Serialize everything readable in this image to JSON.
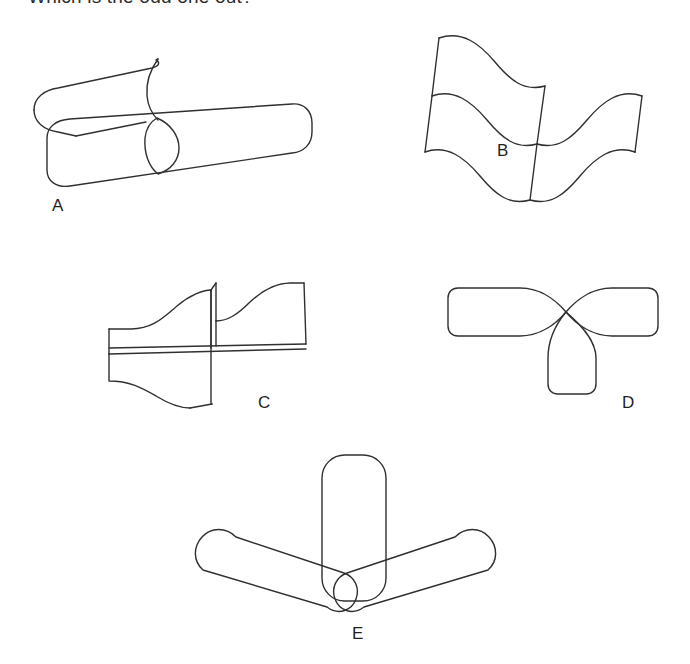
{
  "page": {
    "kind": "visual-reasoning-puzzle",
    "title": "Which is the odd one out?",
    "background_color": "#ffffff",
    "ink_color": "#303030"
  },
  "options": [
    {
      "id": "A",
      "label": "A",
      "figure_name": "two-overlapping-cylinders",
      "description": "Two long rounded cylinders crossing, forming a lens-shaped overlap"
    },
    {
      "id": "B",
      "label": "B",
      "figure_name": "two-crossing-wavy-bands",
      "description": "Two wavy ribbon bands overlapping end to end"
    },
    {
      "id": "C",
      "label": "C",
      "figure_name": "two-crossing-flared-bands",
      "description": "Two flared trumpet-shaped bands crossing at right angles"
    },
    {
      "id": "D",
      "label": "D",
      "figure_name": "three-lobes-meeting-at-point",
      "description": "Three rounded lobes radiating from a single central point"
    },
    {
      "id": "E",
      "label": "E",
      "figure_name": "three-capsules-meeting-at-point",
      "description": "Three rounded capsules radiating from a bottom centre point"
    }
  ]
}
